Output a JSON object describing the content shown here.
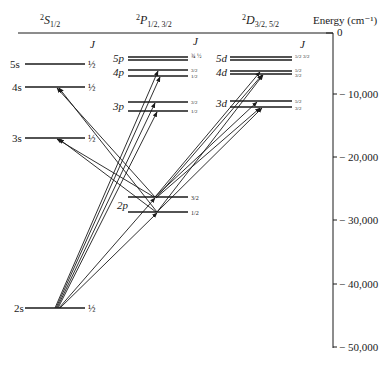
{
  "headers": {
    "s": {
      "sup": "2",
      "main": "S",
      "sub": "1/2"
    },
    "p": {
      "sup": "2",
      "main": "P",
      "sub": "1/2, 3/2"
    },
    "d": {
      "sup": "2",
      "main": "D",
      "sub": "3/2, 5/2"
    },
    "energy": "Energy (cm⁻¹)",
    "j_label": "J"
  },
  "axis": {
    "ticks": [
      {
        "label": "0",
        "value": 0
      },
      {
        "label": "− 10,000",
        "value": -10000
      },
      {
        "label": "− 20,000",
        "value": -20000
      },
      {
        "label": "− 30,000",
        "value": -30000
      },
      {
        "label": "− 40,000",
        "value": -40000
      },
      {
        "label": "− 50,000",
        "value": -50000
      }
    ]
  },
  "levels": {
    "s": [
      {
        "name": "5s",
        "j": [
          "½"
        ]
      },
      {
        "name": "4s",
        "j": [
          "½"
        ]
      },
      {
        "name": "3s",
        "j": [
          "½"
        ]
      },
      {
        "name": "2s",
        "j": [
          "½"
        ]
      }
    ],
    "p": [
      {
        "name": "5p",
        "j": [
          "¾",
          "½"
        ]
      },
      {
        "name": "4p",
        "j": [
          "3/2",
          "1/2"
        ]
      },
      {
        "name": "3p",
        "j": [
          "3/2",
          "1/2"
        ]
      },
      {
        "name": "2p",
        "j": [
          "3/2",
          "1/2"
        ]
      }
    ],
    "d": [
      {
        "name": "5d",
        "j": [
          "5/2",
          "3/2"
        ]
      },
      {
        "name": "4d",
        "j": [
          "5/2",
          "3/2"
        ]
      },
      {
        "name": "3d",
        "j": [
          "5/2",
          "3/2"
        ]
      }
    ]
  },
  "colors": {
    "ink": "#1a1a1a",
    "background": "#ffffff"
  }
}
